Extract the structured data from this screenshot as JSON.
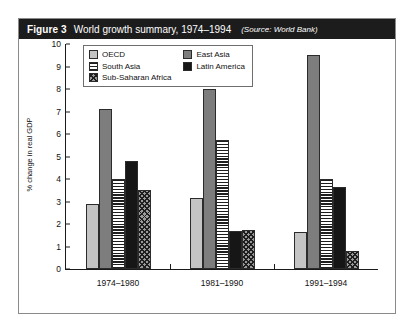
{
  "figure": {
    "number": "Figure 3",
    "title": "World growth summary, 1974–1994",
    "source": "(Source: World Bank)"
  },
  "legend": {
    "column_left": [
      {
        "label": "OECD",
        "pattern": "solid-light-gray"
      },
      {
        "label": "South Asia",
        "pattern": "horizontal-stripes"
      },
      {
        "label": "Sub-Saharan Africa",
        "pattern": "diagonal-crosshatch"
      }
    ],
    "column_right": [
      {
        "label": "East Asia",
        "pattern": "solid-medium-gray"
      },
      {
        "label": "Latin America",
        "pattern": "solid-black"
      }
    ]
  },
  "colors": {
    "oecd": "#c4c4c4",
    "east_asia": "#7d7d7d",
    "latin_america": "#161616",
    "title_bar": "#1c1c1c",
    "axis": "#1a1a1a"
  },
  "chart_data": {
    "type": "bar",
    "title": "World growth summary, 1974–1994",
    "xlabel": "",
    "ylabel": "% change in real GDP",
    "ylim": [
      0,
      10
    ],
    "yticks": [
      0,
      1,
      2,
      3,
      4,
      5,
      6,
      7,
      8,
      9,
      10
    ],
    "grid": false,
    "legend_position": "top-left-inside",
    "categories": [
      "1974–1980",
      "1981–1990",
      "1991–1994"
    ],
    "series": [
      {
        "name": "OECD",
        "values": [
          2.9,
          3.15,
          1.65
        ]
      },
      {
        "name": "East Asia",
        "values": [
          7.1,
          8.0,
          9.5
        ]
      },
      {
        "name": "South Asia",
        "values": [
          4.0,
          5.75,
          4.0
        ]
      },
      {
        "name": "Latin America",
        "values": [
          4.8,
          1.7,
          3.65
        ]
      },
      {
        "name": "Sub-Saharan Africa",
        "values": [
          3.5,
          1.75,
          0.8
        ]
      }
    ]
  }
}
